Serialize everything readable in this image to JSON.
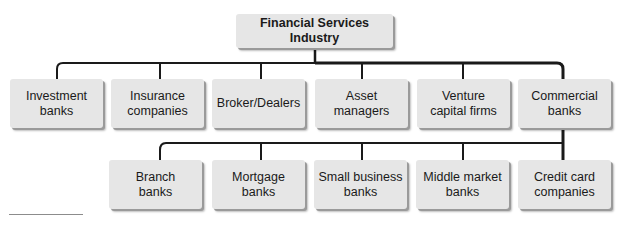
{
  "diagram": {
    "title": "Financial Services Industry",
    "level1": [
      {
        "label": "Investment\nbanks"
      },
      {
        "label": "Insurance\ncompanies"
      },
      {
        "label": "Broker/Dealers"
      },
      {
        "label": "Asset\nmanagers"
      },
      {
        "label": "Venture\ncapital firms"
      },
      {
        "label": "Commercial\nbanks"
      }
    ],
    "level2": [
      {
        "label": "Branch\nbanks"
      },
      {
        "label": "Mortgage\nbanks"
      },
      {
        "label": "Small business\nbanks"
      },
      {
        "label": "Middle market\nbanks"
      },
      {
        "label": "Credit card\ncompanies"
      }
    ],
    "colors": {
      "box_fill": "#e6e6e6",
      "line": "#1a1a1a",
      "text": "#1a1a1a"
    }
  }
}
